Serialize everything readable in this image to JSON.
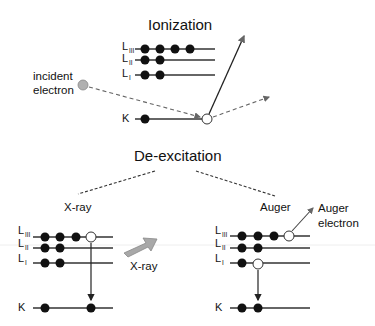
{
  "ionization": {
    "title": "Ionization",
    "levels": [
      "L",
      "L",
      "L",
      "K"
    ],
    "level_subscripts": [
      "III",
      "II",
      "I",
      ""
    ],
    "incident_label_line1": "incident",
    "incident_label_line2": "electron"
  },
  "deexcitation": {
    "title": "De-excitation",
    "xray_branch": {
      "label": "X-ray",
      "arrow_label": "X-ray"
    },
    "auger_branch": {
      "label": "Auger",
      "emitted_label_line1": "Auger",
      "emitted_label_line2": "electron"
    }
  },
  "colors": {
    "electron": "#111111",
    "incident_electron": "#b0b0b0",
    "xray_arrow": "#a8a8a8",
    "lines": "#333333"
  }
}
